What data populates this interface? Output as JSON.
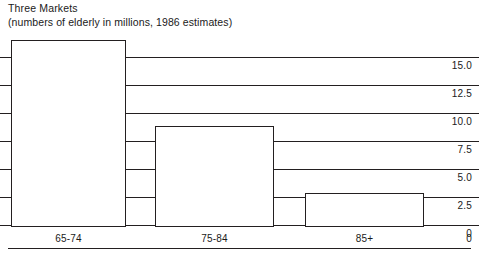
{
  "chart_data": {
    "type": "bar",
    "title": "Three Markets",
    "subtitle": "(numbers of elderly in millions, 1986 estimates)",
    "xlabel": "",
    "ylabel": "",
    "categories": [
      "65-74",
      "75-84",
      "85+"
    ],
    "values": [
      16.5,
      8.8,
      2.9
    ],
    "series": [
      {
        "name": "numbers of elderly in millions",
        "values": [
          16.5,
          8.8,
          2.9
        ]
      }
    ],
    "ylim": [
      0,
      17.5
    ],
    "yticks": [
      15.0,
      12.5,
      10.0,
      7.5,
      5.0,
      2.5,
      0
    ],
    "ytick_labels": [
      "15.0",
      "12.5",
      "10.0",
      "7.5",
      "5.0",
      "2.5",
      "0"
    ],
    "grid": true,
    "grid_axis": "y",
    "legend": false,
    "legend_position": "none",
    "y_axis_side": "right",
    "bar_fill": "#ffffff",
    "bar_edge_color": "#231f20",
    "text_color": "#1a1a1a",
    "background": "#ffffff",
    "annotations": []
  }
}
